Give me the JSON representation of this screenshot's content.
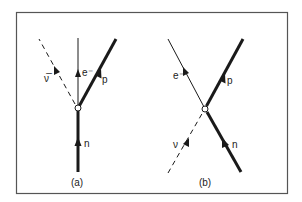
{
  "figure": {
    "border_color": "#555555",
    "line_color": "#1a1a1a",
    "panels": [
      {
        "id": "a",
        "caption": "(a)",
        "vertex": {
          "x": 78,
          "y": 108
        },
        "lines": [
          {
            "particle": "n",
            "label": "n",
            "style": "thick",
            "from": [
              78,
              172
            ],
            "to": [
              78,
              108
            ],
            "arrow_at": [
              78,
              143
            ],
            "arrow_dir": "toward-vertex",
            "label_pos": [
              84,
              146
            ]
          },
          {
            "particle": "e-",
            "label": "e⁻",
            "style": "thin",
            "from": [
              78,
              108
            ],
            "to": [
              78,
              38
            ],
            "arrow_at": [
              78,
              74
            ],
            "arrow_dir": "away-from-vertex",
            "label_pos": [
              82,
              74
            ]
          },
          {
            "particle": "p",
            "label": "p",
            "style": "thick",
            "from": [
              78,
              108
            ],
            "to": [
              116,
              39
            ],
            "arrow_at": [
              99,
              73
            ],
            "arrow_dir": "away-from-vertex",
            "label_pos": [
              102,
              83
            ]
          },
          {
            "particle": "antineutrino",
            "label": "ν̅",
            "style": "dashed",
            "from": [
              74,
              103
            ],
            "to": [
              39,
              39
            ],
            "arrow_at": [
              56,
              70
            ],
            "arrow_dir": "away-from-vertex",
            "label_pos": [
              44,
              82
            ]
          }
        ],
        "caption_pos": [
          77,
          186
        ]
      },
      {
        "id": "b",
        "caption": "(b)",
        "vertex": {
          "x": 205,
          "y": 109
        },
        "lines": [
          {
            "particle": "n",
            "label": "n",
            "style": "thick",
            "from": [
              241,
              172
            ],
            "to": [
              205,
              109
            ],
            "arrow_at": [
              226,
              145
            ],
            "arrow_dir": "toward-vertex",
            "label_pos": [
              233,
              148
            ]
          },
          {
            "particle": "e-",
            "label": "e⁻",
            "style": "thin",
            "from": [
              205,
              109
            ],
            "to": [
              168,
              39
            ],
            "arrow_at": [
              186,
              73
            ],
            "arrow_dir": "away-from-vertex",
            "label_pos": [
              175,
              80
            ]
          },
          {
            "particle": "p",
            "label": "p",
            "style": "thick",
            "from": [
              205,
              109
            ],
            "to": [
              243,
              39
            ],
            "arrow_at": [
              222,
              78
            ],
            "arrow_dir": "away-from-vertex",
            "label_pos": [
              226,
              84
            ]
          },
          {
            "particle": "neutrino",
            "label": "ν",
            "style": "dashed",
            "from": [
              168,
              173
            ],
            "to": [
              202,
              114
            ],
            "arrow_at": [
              186,
              143
            ],
            "arrow_dir": "toward-vertex",
            "label_pos": [
              173,
              148
            ]
          }
        ],
        "caption_pos": [
          205,
          186
        ]
      }
    ]
  },
  "labels": {
    "a": {
      "n": "n",
      "e": "e⁻",
      "p": "p",
      "nu": "ν̅",
      "caption": "(a)"
    },
    "b": {
      "n": "n",
      "e": "e⁻",
      "p": "p",
      "nu": "ν",
      "caption": "(b)"
    }
  }
}
